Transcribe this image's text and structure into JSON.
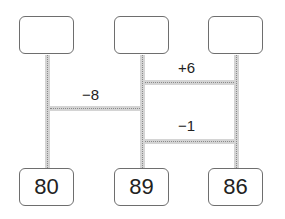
{
  "diagram": {
    "type": "amidakuji-ladder",
    "top_boxes": [
      "",
      "",
      ""
    ],
    "bottom_boxes": [
      "80",
      "89",
      "86"
    ],
    "rungs": [
      {
        "label": "+6",
        "between": [
          2,
          3
        ]
      },
      {
        "label": "−8",
        "between": [
          1,
          2
        ]
      },
      {
        "label": "−1",
        "between": [
          2,
          3
        ]
      }
    ]
  }
}
